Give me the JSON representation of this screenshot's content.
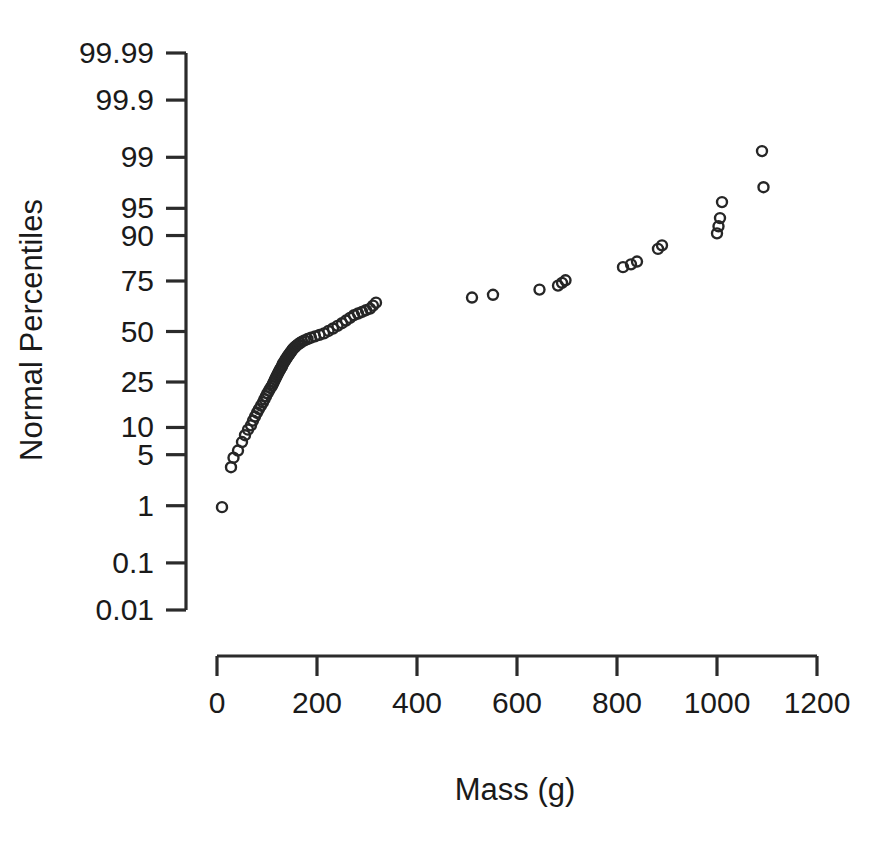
{
  "chart_data": {
    "type": "scatter",
    "title": "",
    "subtitle": "",
    "xlabel": "Mass (g)",
    "ylabel": "Normal Percentiles",
    "grid": false,
    "legend": "none",
    "x_axis": {
      "label": "Mass (g)",
      "ticks": [
        0,
        200,
        400,
        600,
        800,
        1000,
        1200
      ],
      "tick_labels": [
        "0",
        "200",
        "400",
        "600",
        "800",
        "1000",
        "1200"
      ],
      "xlim": [
        0,
        1200
      ],
      "scale": "linear"
    },
    "y_axis": {
      "label": "Normal Percentiles",
      "ticks": [
        99.99,
        99.9,
        99,
        95,
        90,
        75,
        50,
        25,
        10,
        5,
        1,
        0.1,
        0.01
      ],
      "tick_labels": [
        "99.99",
        "99.9",
        "99",
        "95",
        "90",
        "75",
        "50",
        "25",
        "10",
        "5",
        "1",
        "0.1",
        "0.01"
      ],
      "ylim": [
        0.01,
        99.99
      ],
      "scale": "normal-probability"
    },
    "marker": {
      "shape": "open-circle",
      "radius_px": 5,
      "color": "#262626",
      "fill": "none"
    },
    "series": [
      {
        "name": "Mass percentiles",
        "x": [
          10,
          28,
          33,
          42,
          50,
          56,
          62,
          68,
          72,
          76,
          80,
          84,
          88,
          92,
          95,
          98,
          101,
          104,
          107,
          110,
          112,
          114,
          116,
          118,
          120,
          122,
          124,
          126,
          128,
          130,
          131,
          133,
          135,
          137,
          139,
          141,
          143,
          145,
          147,
          149,
          151,
          153,
          156,
          159,
          162,
          166,
          170,
          175,
          181,
          188,
          196,
          205,
          214,
          223,
          232,
          241,
          250,
          258,
          266,
          274,
          282,
          290,
          298,
          306,
          312,
          318,
          510,
          552,
          645,
          682,
          690,
          697,
          812,
          828,
          840,
          882,
          890,
          1000,
          1003,
          1006,
          1010,
          1090,
          1093
        ],
        "y": [
          0.95,
          3.5,
          4.6,
          5.6,
          7.0,
          8.3,
          9.5,
          10.5,
          11.7,
          12.8,
          13.9,
          15.0,
          16.1,
          17.2,
          18.3,
          19.4,
          20.5,
          21.5,
          22.5,
          23.4,
          24.3,
          25.2,
          26.1,
          27.0,
          27.9,
          28.8,
          29.7,
          30.5,
          31.3,
          32.1,
          32.9,
          33.7,
          34.5,
          35.3,
          36.1,
          36.9,
          37.6,
          38.3,
          39.0,
          39.7,
          40.4,
          41.1,
          41.8,
          42.5,
          43.2,
          43.9,
          44.6,
          45.3,
          46.0,
          46.7,
          47.4,
          48.2,
          49.0,
          50.3,
          51.6,
          53.0,
          54.4,
          55.8,
          57.2,
          58.6,
          59.5,
          60.3,
          61.2,
          62.0,
          63.5,
          65.0,
          67.5,
          68.8,
          71.2,
          73.0,
          74.2,
          75.3,
          80.5,
          81.5,
          82.5,
          86.5,
          87.5,
          90.5,
          92.0,
          93.5,
          95.8,
          99.2,
          97.3
        ]
      }
    ]
  },
  "figure": {
    "background_color": "#ffffff",
    "axis_color": "#2b2b2b",
    "text_color": "#1a1a1a"
  }
}
